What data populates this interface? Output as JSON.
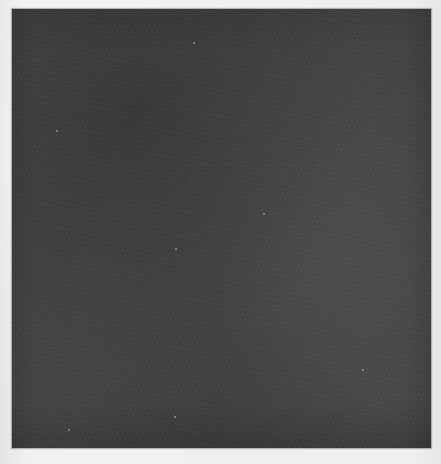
{
  "image": {
    "description": "Scanned dark grey textured square on light paper background",
    "colors": {
      "background": "#ececec",
      "swatch": "#454545"
    },
    "swatch_bounds": {
      "x": 12,
      "y": 9,
      "width": 419,
      "height": 439
    }
  }
}
